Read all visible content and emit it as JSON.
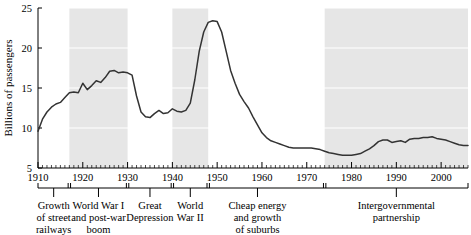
{
  "chart_data": {
    "type": "line",
    "title": "",
    "xlabel": "",
    "ylabel": "Billions of passengers",
    "xlim": [
      1910,
      2006
    ],
    "ylim": [
      5,
      25
    ],
    "grid": true,
    "gridlines_y": [
      10,
      15,
      20,
      25
    ],
    "legend": "none",
    "yticks": [
      5,
      10,
      15,
      20,
      25
    ],
    "ytick_labels": [
      "5",
      "10",
      "15",
      "20",
      "25"
    ],
    "xticks": [
      1910,
      1920,
      1930,
      1940,
      1950,
      1960,
      1970,
      1980,
      1990,
      2000
    ],
    "xtick_labels": [
      "1910",
      "1920",
      "1930",
      "1940",
      "1950",
      "1960",
      "1970",
      "1980",
      "1990",
      "2000"
    ],
    "minor_tick_interval": 1,
    "line_color": "#333333",
    "shade_color": "#e6e6e6",
    "series": [
      {
        "name": "Transit passengers",
        "x": [
          1910,
          1911,
          1912,
          1913,
          1914,
          1915,
          1916,
          1917,
          1918,
          1919,
          1920,
          1921,
          1922,
          1923,
          1924,
          1925,
          1926,
          1927,
          1928,
          1929,
          1930,
          1931,
          1932,
          1933,
          1934,
          1935,
          1936,
          1937,
          1938,
          1939,
          1940,
          1941,
          1942,
          1943,
          1944,
          1945,
          1946,
          1947,
          1948,
          1949,
          1950,
          1951,
          1952,
          1953,
          1954,
          1955,
          1956,
          1957,
          1958,
          1959,
          1960,
          1961,
          1962,
          1963,
          1964,
          1965,
          1966,
          1967,
          1968,
          1969,
          1970,
          1971,
          1972,
          1973,
          1974,
          1975,
          1976,
          1977,
          1978,
          1979,
          1980,
          1981,
          1982,
          1983,
          1984,
          1985,
          1986,
          1987,
          1988,
          1989,
          1990,
          1991,
          1992,
          1993,
          1994,
          1995,
          1996,
          1997,
          1998,
          1999,
          2000,
          2001,
          2002,
          2003,
          2004,
          2005,
          2006
        ],
        "y": [
          9.6,
          11.1,
          12.0,
          12.6,
          13.0,
          13.2,
          13.8,
          14.4,
          14.5,
          14.4,
          15.6,
          14.8,
          15.3,
          15.9,
          15.7,
          16.3,
          17.1,
          17.2,
          16.9,
          17.0,
          16.9,
          16.6,
          14.0,
          12.0,
          11.4,
          11.3,
          11.8,
          12.2,
          11.8,
          11.9,
          12.4,
          12.1,
          12.0,
          12.2,
          13.1,
          16.0,
          19.6,
          22.0,
          23.2,
          23.4,
          23.3,
          22.0,
          19.6,
          17.2,
          15.6,
          14.2,
          13.3,
          12.5,
          11.4,
          10.4,
          9.4,
          8.8,
          8.4,
          8.2,
          8.0,
          7.8,
          7.6,
          7.5,
          7.5,
          7.5,
          7.5,
          7.5,
          7.4,
          7.3,
          7.1,
          6.9,
          6.8,
          6.7,
          6.6,
          6.6,
          6.6,
          6.7,
          6.8,
          7.1,
          7.4,
          7.8,
          8.3,
          8.5,
          8.5,
          8.2,
          8.3,
          8.4,
          8.2,
          8.6,
          8.7,
          8.7,
          8.8,
          8.8,
          8.9,
          8.7,
          8.6,
          8.5,
          8.3,
          8.1,
          7.9,
          7.8,
          7.8
        ],
        "modern_extension_x": [
          2007,
          2008,
          2009,
          2010,
          2011,
          2012,
          2013
        ],
        "modern_extension_y": [
          8.0,
          8.3,
          8.6,
          8.9,
          9.5,
          9.4,
          9.3
        ]
      }
    ],
    "shaded_regions": [
      {
        "label": "World War I and post-war boom",
        "start": 1917,
        "end": 1930
      },
      {
        "label": "World War II",
        "start": 1940,
        "end": 1948
      },
      {
        "label": "Intergovernmental partnership",
        "start": 1974,
        "end": 2006
      }
    ],
    "period_annotations": [
      {
        "label_lines": [
          "Growth",
          "of street",
          "railways"
        ],
        "start": 1910,
        "end": 1917,
        "center": 1913.5
      },
      {
        "label_lines": [
          "World War I",
          "and post-war",
          "boom"
        ],
        "start": 1917,
        "end": 1930,
        "center": 1923.5
      },
      {
        "label_lines": [
          "Great",
          "Depression"
        ],
        "start": 1930,
        "end": 1940,
        "center": 1935
      },
      {
        "label_lines": [
          "World",
          "War II"
        ],
        "start": 1940,
        "end": 1948,
        "center": 1944
      },
      {
        "label_lines": [
          "Cheap energy",
          "and growth",
          "of suburbs"
        ],
        "start": 1948,
        "end": 1974,
        "center": 1959
      },
      {
        "label_lines": [
          "Intergovernmental",
          "partnership"
        ],
        "start": 1974,
        "end": 2006,
        "center": 1990
      }
    ]
  }
}
